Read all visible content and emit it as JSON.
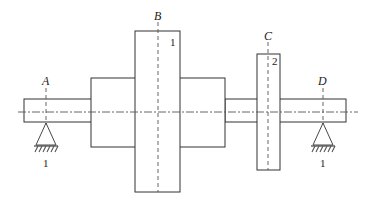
{
  "diagram": {
    "type": "stepped-shaft-with-disks",
    "section_labels": {
      "A": "A",
      "B": "B",
      "C": "C",
      "D": "D"
    },
    "part_numbers": {
      "disk_B": "1",
      "disk_C": "2",
      "support_A": "1",
      "support_D": "1"
    },
    "colors": {
      "line": "#333333",
      "background": "#ffffff"
    }
  }
}
